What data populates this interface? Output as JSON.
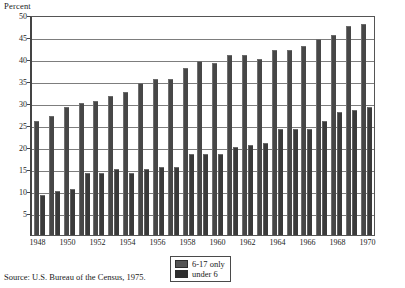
{
  "chart_data": {
    "type": "bar",
    "title": "",
    "xlabel": "",
    "ylabel": "Percent",
    "ylim": [
      0,
      50
    ],
    "yticks": [
      50,
      45,
      40,
      35,
      30,
      25,
      20,
      15,
      10,
      5
    ],
    "grid": true,
    "legend_position": "bottom-center",
    "categories": [
      "1948",
      "1949",
      "1950",
      "1951",
      "1952",
      "1953",
      "1954",
      "1955",
      "1956",
      "1957",
      "1958",
      "1959",
      "1960",
      "1961",
      "1962",
      "1963",
      "1964",
      "1965",
      "1966",
      "1967",
      "1968",
      "1969",
      "1970"
    ],
    "xtick_labels": [
      "1948",
      "1950",
      "1952",
      "1954",
      "1956",
      "1958",
      "1960",
      "1962",
      "1964",
      "1966",
      "1968",
      "1970"
    ],
    "series": [
      {
        "name": "6-17 only",
        "color": "#474747",
        "values": [
          26,
          27,
          29,
          30,
          30.5,
          31.5,
          32.5,
          34.5,
          35.5,
          35.5,
          38,
          39.5,
          39,
          41,
          41,
          40,
          42,
          42,
          43,
          44.5,
          45.5,
          47.5,
          48
        ]
      },
      {
        "name": "under 6",
        "color": "#3a3a3a",
        "values": [
          9,
          10,
          10.5,
          14,
          14,
          15,
          14,
          15,
          15.5,
          15.5,
          18.5,
          18.5,
          18.5,
          20,
          20.5,
          21,
          24,
          24,
          24,
          26,
          28,
          28.5,
          29
        ]
      }
    ]
  },
  "legend": {
    "items": [
      {
        "label": "6-17 only"
      },
      {
        "label": "under 6"
      }
    ]
  },
  "source": {
    "text": "Source: U.S. Bureau of the Census, 1975."
  }
}
